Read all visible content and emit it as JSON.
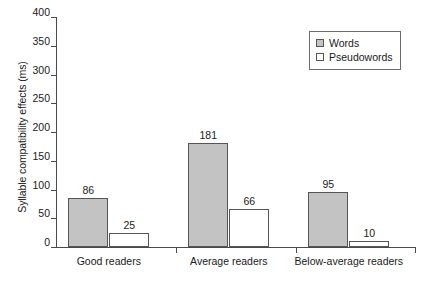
{
  "chart_data": {
    "type": "bar",
    "title": "",
    "xlabel": "",
    "ylabel": "Syllable compatibility effects (ms)",
    "categories": [
      "Good readers",
      "Average readers",
      "Below-average readers"
    ],
    "series": [
      {
        "name": "Words",
        "values": [
          86,
          181,
          95
        ],
        "color": "#c3c3c3"
      },
      {
        "name": "Pseudowords",
        "values": [
          25,
          66,
          10
        ],
        "color": "#ffffff"
      }
    ],
    "ylim": [
      0,
      400
    ],
    "ytick_step": 50,
    "ytick_labels": [
      "400",
      "350",
      "300",
      "250",
      "200",
      "150",
      "100",
      "50",
      "0"
    ],
    "grid": false,
    "legend_position": "top-right",
    "data_labels": [
      "86",
      "25",
      "181",
      "66",
      "95",
      "10"
    ]
  },
  "legend": {
    "entries": [
      {
        "label": "Words",
        "swatch": "filled-gray-square-icon"
      },
      {
        "label": "Pseudowords",
        "swatch": "open-white-square-icon"
      }
    ]
  }
}
